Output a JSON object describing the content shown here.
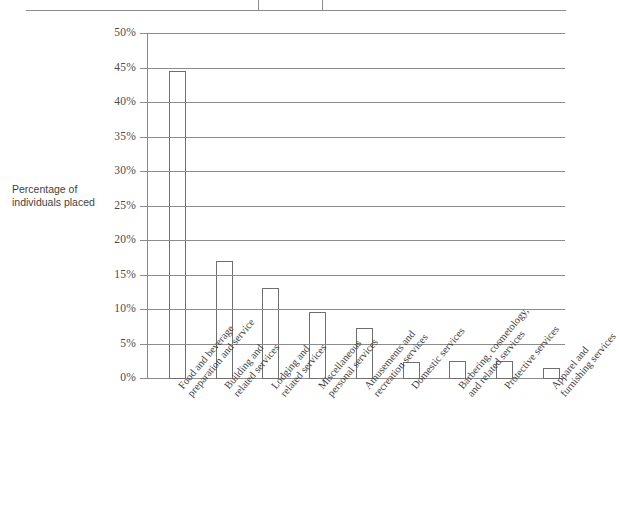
{
  "axis_title": {
    "line1": "Percentage of",
    "line2": "individuals placed"
  },
  "table_fragment": {
    "name": "partial-table-above-chart"
  },
  "chart_data": {
    "type": "bar",
    "title": "",
    "subtitle": "",
    "xlabel": "",
    "ylabel": "Percentage of individuals placed",
    "ylim": [
      0,
      50
    ],
    "ytick_labels": [
      "0%",
      "5%",
      "10%",
      "15%",
      "20%",
      "25%",
      "30%",
      "35%",
      "40%",
      "45%",
      "50%"
    ],
    "ytick_values": [
      0,
      5,
      10,
      15,
      20,
      25,
      30,
      35,
      40,
      45,
      50
    ],
    "grid": "horizontal",
    "legend": "none",
    "bar_color": "#ffffff",
    "bar_border_color": "#6f6f6f",
    "grid_color": "#8b8b8b",
    "categories": [
      "Food and beverage preparation and service",
      "Building and related services",
      "Lodging and related services",
      "Miscellaneous personal services",
      "Amusements and recreation services",
      "Domestic services",
      "Barbering, cosmetology, and related services",
      "Protective services",
      "Apparel and furnishing services"
    ],
    "category_lines": [
      [
        "Food and beverage",
        "preparation and service"
      ],
      [
        "Building and",
        "related services"
      ],
      [
        "Lodging and",
        "related services"
      ],
      [
        "Miscellaneous",
        "personal services"
      ],
      [
        "Amusements and",
        "recreation services"
      ],
      [
        "Domestic services"
      ],
      [
        "Barbering, cosmetology,",
        "and related services"
      ],
      [
        "Protective services"
      ],
      [
        "Apparel and",
        "furnishing services"
      ]
    ],
    "values": [
      44.5,
      16.9,
      13.1,
      9.6,
      7.2,
      2.3,
      2.5,
      2.4,
      1.4
    ]
  }
}
